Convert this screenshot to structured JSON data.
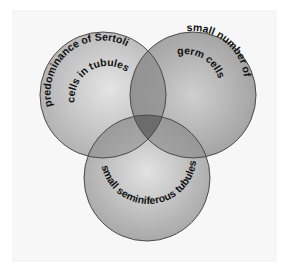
{
  "diagram": {
    "type": "venn",
    "sets": [
      {
        "id": "left",
        "label_line1": "predominance of Sertoli",
        "label_line2": "cells in tubules",
        "cx": 103,
        "cy": 95,
        "r": 63
      },
      {
        "id": "right",
        "label_line1": "small number of",
        "label_line2": "germ cells",
        "cx": 193,
        "cy": 95,
        "r": 63
      },
      {
        "id": "bottom",
        "label_line1": "small seminiferous tubules",
        "cx": 147,
        "cy": 178,
        "r": 63
      }
    ],
    "colors": {
      "background": "#ffffff",
      "panel": "#f7f7f7",
      "circle_light": "#e6e6e6",
      "circle_dark": "#a8a8a8",
      "outline": "#4a4a4a",
      "text": "#111111"
    }
  }
}
